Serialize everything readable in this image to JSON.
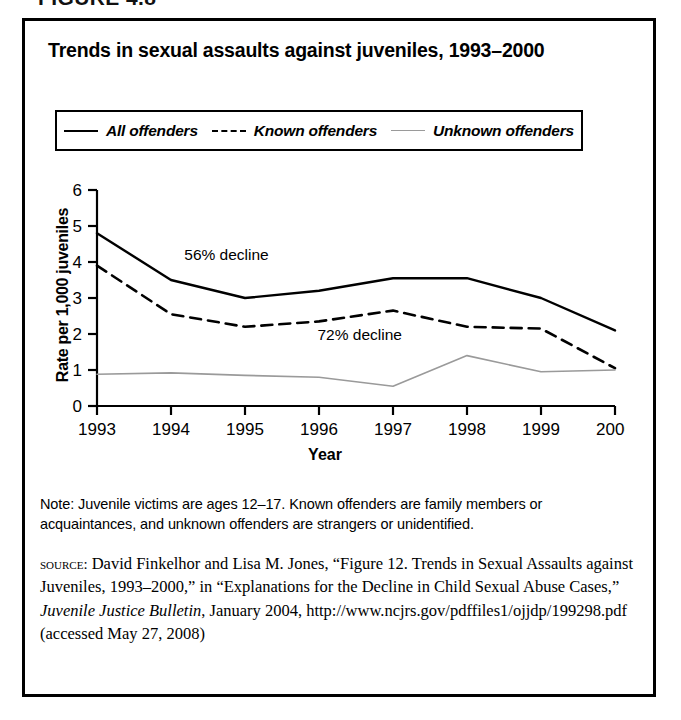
{
  "figure": {
    "number_label": "FIGURE 4.8",
    "title": "Trends in sexual assaults against juveniles, 1993–2000"
  },
  "legend": {
    "entries": [
      {
        "label": "All offenders",
        "style": "solid-dark",
        "color": "#000000"
      },
      {
        "label": "Known offenders",
        "style": "dashed-dark",
        "color": "#000000"
      },
      {
        "label": "Unknown offenders",
        "style": "solid-light",
        "color": "#9a9a9a"
      }
    ]
  },
  "axes": {
    "y_title": "Rate per 1,000 juveniles",
    "x_title": "Year",
    "y_ticks": [
      "0",
      "1",
      "2",
      "3",
      "4",
      "5",
      "6"
    ],
    "x_ticks": [
      "1993",
      "1994",
      "1995",
      "1996",
      "1997",
      "1998",
      "1999",
      "2000"
    ]
  },
  "annotations": [
    {
      "text": "56% decline",
      "x": 1994.75,
      "y": 4.05
    },
    {
      "text": "72% decline",
      "x": 1996.55,
      "y": 1.82
    }
  ],
  "notes": {
    "note_text": "Note: Juvenile victims are ages 12–17. Known offenders are family members or acquaintances, and unknown offenders are strangers or unidentified."
  },
  "source": {
    "label": "source:",
    "text_1": " David Finkelhor and Lisa M. Jones, “Figure 12. Trends in Sexual Assaults against Juveniles, 1993–2000,” in “Explanations for the Decline in Child Sexual Abuse Cases,” ",
    "italic_title": "Juvenile Justice Bulletin",
    "text_2": ", January 2004, http://www.ncjrs.gov/pdffiles1/ojjdp/199298.pdf (accessed May 27, 2008)"
  },
  "chart_data": {
    "type": "line",
    "title": "Trends in sexual assaults against juveniles, 1993–2000",
    "xlabel": "Year",
    "ylabel": "Rate per 1,000 juveniles",
    "categories": [
      "1993",
      "1994",
      "1995",
      "1996",
      "1997",
      "1998",
      "1999",
      "2000"
    ],
    "x": [
      1993,
      1994,
      1995,
      1996,
      1997,
      1998,
      1999,
      2000
    ],
    "ylim": [
      0,
      6
    ],
    "yticks": [
      0,
      1,
      2,
      3,
      4,
      5,
      6
    ],
    "grid": false,
    "legend_position": "top",
    "series": [
      {
        "name": "All offenders",
        "color": "#000000",
        "line_style": "solid",
        "line_width": 2.4,
        "values": [
          4.8,
          3.5,
          3.0,
          3.2,
          3.55,
          3.55,
          3.0,
          2.1
        ]
      },
      {
        "name": "Known offenders",
        "color": "#000000",
        "line_style": "dashed",
        "line_width": 2.6,
        "values": [
          3.9,
          2.55,
          2.2,
          2.35,
          2.65,
          2.2,
          2.15,
          1.05
        ]
      },
      {
        "name": "Unknown offenders",
        "color": "#9a9a9a",
        "line_style": "solid",
        "line_width": 1.6,
        "values": [
          0.88,
          0.92,
          0.85,
          0.8,
          0.55,
          1.4,
          0.95,
          1.0
        ]
      }
    ],
    "annotations": [
      {
        "text": "56% decline",
        "x": 1994.75,
        "y": 4.05
      },
      {
        "text": "72% decline",
        "x": 1996.55,
        "y": 1.82
      }
    ]
  }
}
